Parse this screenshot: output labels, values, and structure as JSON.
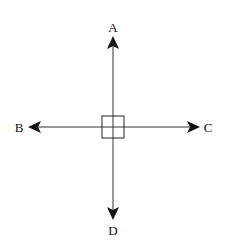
{
  "diagram": {
    "type": "force-diagram",
    "center": {
      "x": 113,
      "y": 127,
      "box_size": 22
    },
    "arrows": [
      {
        "id": "A",
        "label": "A",
        "direction": "up"
      },
      {
        "id": "B",
        "label": "B",
        "direction": "left"
      },
      {
        "id": "C",
        "label": "C",
        "direction": "right"
      },
      {
        "id": "D",
        "label": "D",
        "direction": "down"
      }
    ],
    "colors": {
      "line": "#222222",
      "background": "#ffffff"
    }
  }
}
